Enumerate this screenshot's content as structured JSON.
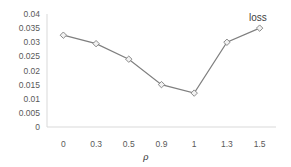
{
  "chart_data": {
    "type": "line",
    "title": "",
    "xlabel": "ρ",
    "ylabel": "",
    "categories": [
      "0",
      "0.3",
      "0.5",
      "0.9",
      "1",
      "1.3",
      "1.5"
    ],
    "series": [
      {
        "name": "loss",
        "values": [
          0.0325,
          0.0295,
          0.024,
          0.015,
          0.012,
          0.03,
          0.035
        ],
        "color": "#7f7f7f",
        "marker": "diamond"
      }
    ],
    "ylim": [
      0,
      0.04
    ],
    "yticks": [
      "0",
      "0.005",
      "0.01",
      "0.015",
      "0.02",
      "0.025",
      "0.03",
      "0.035",
      "0.04"
    ],
    "grid": false,
    "legend_position": "inline-top-right"
  }
}
